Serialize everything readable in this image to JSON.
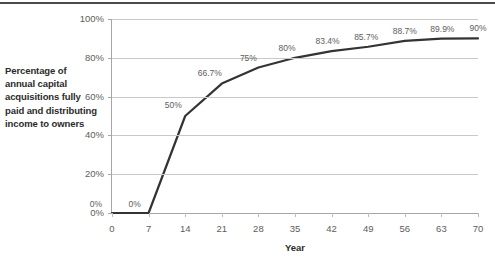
{
  "chart_data": {
    "type": "line",
    "title": "",
    "xlabel": "Year",
    "ylabel": "Percentage of annual capital acquisitions fully paid and distributing income to owners",
    "x": [
      0,
      7,
      14,
      21,
      28,
      35,
      42,
      49,
      56,
      63,
      70
    ],
    "values": [
      0,
      0,
      50,
      66.7,
      75,
      80,
      83.4,
      85.7,
      88.7,
      89.9,
      90
    ],
    "point_labels": [
      "0%",
      "0%",
      "50%",
      "66.7%",
      "75%",
      "80%",
      "83.4%",
      "85.7%",
      "88.7%",
      "89.9%",
      "90%"
    ],
    "xlim": [
      0,
      70
    ],
    "ylim": [
      0,
      100
    ],
    "xticks": [
      0,
      7,
      14,
      21,
      28,
      35,
      42,
      49,
      56,
      63,
      70
    ],
    "xtick_labels": [
      "0",
      "7",
      "14",
      "21",
      "28",
      "35",
      "42",
      "49",
      "56",
      "63",
      "70"
    ],
    "yticks": [
      0,
      20,
      40,
      60,
      80,
      100
    ],
    "ytick_labels": [
      "0%",
      "20%",
      "40%",
      "60%",
      "80%",
      "100%"
    ],
    "grid": "horizontal",
    "legend": "none",
    "series_color": "#333333",
    "gridline_color": "#c9c9c9",
    "axis_color": "#a6a6a6",
    "label_color": "#5d5d5d",
    "background": "#ffffff"
  }
}
